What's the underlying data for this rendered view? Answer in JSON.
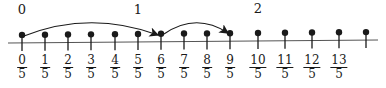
{
  "diagram": {
    "type": "number-line",
    "whole_labels": [
      {
        "text": "0",
        "x": 22,
        "y": 2
      },
      {
        "text": "1",
        "x": 138,
        "y": 2
      },
      {
        "text": "2",
        "x": 258,
        "y": 1
      }
    ],
    "ticks": [
      {
        "num": "0",
        "den": "5",
        "x": 22
      },
      {
        "num": "1",
        "den": "5",
        "x": 45
      },
      {
        "num": "2",
        "den": "5",
        "x": 68
      },
      {
        "num": "3",
        "den": "5",
        "x": 91
      },
      {
        "num": "4",
        "den": "5",
        "x": 115
      },
      {
        "num": "5",
        "den": "5",
        "x": 138
      },
      {
        "num": "6",
        "den": "5",
        "x": 161
      },
      {
        "num": "7",
        "den": "5",
        "x": 184
      },
      {
        "num": "8",
        "den": "5",
        "x": 207
      },
      {
        "num": "9",
        "den": "5",
        "x": 230
      },
      {
        "num": "10",
        "den": "5",
        "x": 258
      },
      {
        "num": "11",
        "den": "5",
        "x": 285
      },
      {
        "num": "12",
        "den": "5",
        "x": 312
      },
      {
        "num": "13",
        "den": "5",
        "x": 339
      },
      {
        "num": "",
        "den": "",
        "x": 366
      }
    ],
    "jumps": [
      {
        "from": "0/5",
        "to": "6/5",
        "from_x": 22,
        "to_x": 161
      },
      {
        "from": "6/5",
        "to": "9/5",
        "from_x": 161,
        "to_x": 230
      }
    ],
    "colors": {
      "ink": "#1a1a1a",
      "background": "#ffffff"
    }
  }
}
